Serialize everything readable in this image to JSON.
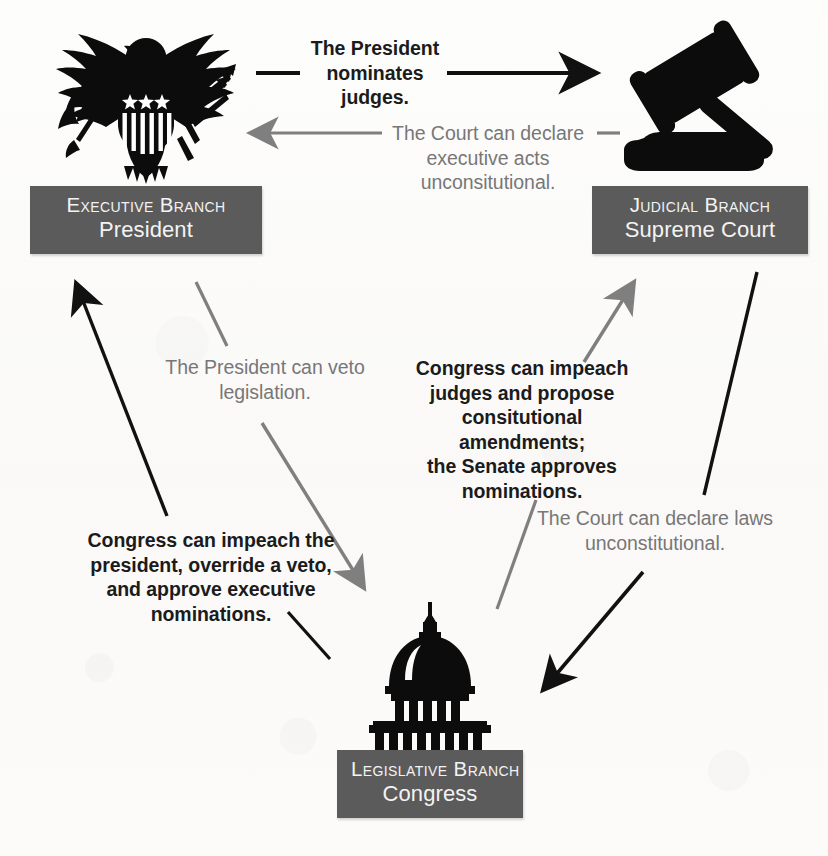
{
  "diagram": {
    "background_color": "#fcfbfa",
    "label_box_color": "#5b5b5b",
    "label_text_color": "#f3f3f3",
    "dark_text_color": "#1b1b1b",
    "light_text_color": "#777777"
  },
  "nodes": {
    "executive": {
      "icon": "eagle-emblem-icon",
      "branch": "Executive Branch",
      "body": "President"
    },
    "judicial": {
      "icon": "gavel-icon",
      "branch": "Judicial Branch",
      "body": "Supreme Court"
    },
    "legislative": {
      "icon": "capitol-dome-icon",
      "branch": "Legislative Branch",
      "body": "Congress"
    }
  },
  "captions": {
    "president_nominates": {
      "lines": [
        "The President",
        "nominates judges."
      ],
      "text": "The President nominates judges.",
      "style": "dark",
      "from": "executive",
      "to": "judicial"
    },
    "court_declares_executive_acts": {
      "lines": [
        "The Court can declare",
        "executive acts",
        "unconsitutional."
      ],
      "text": "The Court can declare executive acts unconsitutional.",
      "style": "light",
      "from": "judicial",
      "to": "executive"
    },
    "president_veto": {
      "lines": [
        "The President can veto",
        "legislation."
      ],
      "text": "The President can veto legislation.",
      "style": "light",
      "from": "executive",
      "to": "legislative"
    },
    "congress_impeach_judges": {
      "lines": [
        "Congress can impeach",
        "judges and propose",
        "consitutional amendments;",
        "the Senate approves",
        "nominations."
      ],
      "text": "Congress can impeach judges and propose consitutional amendments; the Senate approves nominations.",
      "style": "dark",
      "from": "legislative",
      "to": "judicial"
    },
    "congress_impeach_president": {
      "lines": [
        "Congress can impeach the",
        "president, override a veto,",
        "and approve executive",
        "nominations."
      ],
      "text": "Congress can impeach the president, override a veto, and approve executive nominations.",
      "style": "dark",
      "from": "legislative",
      "to": "executive"
    },
    "court_declares_laws": {
      "lines": [
        "The Court can declare laws",
        "unconstitutional."
      ],
      "text": "The Court can declare laws unconstitutional.",
      "style": "light",
      "from": "judicial",
      "to": "legislative"
    }
  },
  "arrows": [
    {
      "name": "executive-to-judicial",
      "color": "#111111",
      "label": "president_nominates"
    },
    {
      "name": "judicial-to-executive",
      "color": "#7f7f7f",
      "label": "court_declares_executive_acts"
    },
    {
      "name": "legislative-to-executive",
      "color": "#111111",
      "label": "congress_impeach_president"
    },
    {
      "name": "executive-to-legislative",
      "color": "#7f7f7f",
      "label": "president_veto"
    },
    {
      "name": "legislative-to-judicial",
      "color": "#7f7f7f",
      "label": "congress_impeach_judges"
    },
    {
      "name": "judicial-to-legislative",
      "color": "#111111",
      "label": "court_declares_laws"
    }
  ]
}
